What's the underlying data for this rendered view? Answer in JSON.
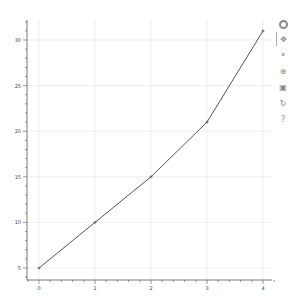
{
  "chart_data": {
    "type": "line",
    "title": "",
    "xlabel": "",
    "ylabel": "",
    "x": [
      0,
      1,
      2,
      3,
      4
    ],
    "series": [
      {
        "name": "",
        "values": [
          5,
          10,
          15,
          21,
          31
        ],
        "color": "#555555",
        "markers": "cross"
      }
    ],
    "xticks": [
      0,
      1,
      2,
      3,
      4
    ],
    "yticks": [
      5,
      10,
      15,
      20,
      25,
      30
    ],
    "xlim": [
      -0.2,
      4.2
    ],
    "ylim": [
      3.5,
      32.5
    ],
    "grid": true,
    "legend": null
  },
  "toolbar": {
    "tools": [
      {
        "name": "bokeh-logo",
        "glyph": ""
      },
      {
        "name": "pan-tool",
        "glyph": "✥"
      },
      {
        "name": "box-zoom-tool",
        "glyph": "⌕"
      },
      {
        "name": "wheel-zoom-tool",
        "glyph": "⊕"
      },
      {
        "name": "save-tool",
        "glyph": "▣"
      },
      {
        "name": "reset-tool",
        "glyph": "↻"
      },
      {
        "name": "help-tool",
        "glyph": "?"
      }
    ]
  }
}
